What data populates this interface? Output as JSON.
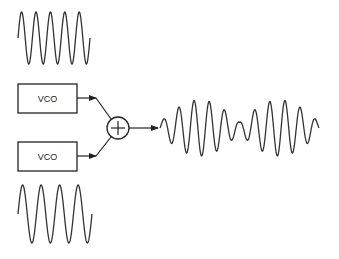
{
  "diagram": {
    "title": "",
    "colors": {
      "stroke": "#333333",
      "background": "#ffffff"
    },
    "blocks": [
      {
        "id": "vco1",
        "label": "VCO",
        "x": 18,
        "y": 84,
        "w": 59,
        "h": 29
      },
      {
        "id": "vco2",
        "label": "VCO",
        "x": 18,
        "y": 142,
        "w": 59,
        "h": 29
      }
    ],
    "summing_junction": {
      "symbol": "+",
      "cx": 118,
      "cy": 128,
      "r": 11
    },
    "waveforms": {
      "top_input": {
        "x0": 18,
        "x1": 90,
        "cy": 38,
        "amp": 26,
        "cycles": 5
      },
      "bottom_input": {
        "x0": 18,
        "x1": 92,
        "cy": 214,
        "amp": 29,
        "cycles": 4
      },
      "output_beat": {
        "x0": 160,
        "x1": 319,
        "cy": 128,
        "amp": 28,
        "cycles": 10.5,
        "beats": 2
      }
    }
  }
}
